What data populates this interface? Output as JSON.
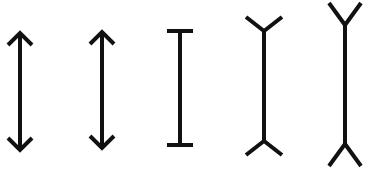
{
  "diagram": {
    "description": "Five vertical line figures with different end terminations (Müller-Lyer style illusion)",
    "stroke_color": "#111111",
    "background_color": "#ffffff",
    "figures": [
      {
        "id": "fig1",
        "type": "double-arrow",
        "label": "double-headed arrow (inward arrowheads)",
        "x": 20,
        "y_top": 33,
        "y_bottom": 150,
        "head_size": 12,
        "stroke_width": 4
      },
      {
        "id": "fig2",
        "type": "double-arrow",
        "label": "double-headed arrow (inward arrowheads)",
        "x": 102,
        "y_top": 32,
        "y_bottom": 148,
        "head_size": 12,
        "stroke_width": 4
      },
      {
        "id": "fig3",
        "type": "i-beam",
        "label": "line with flat end caps",
        "x": 180,
        "y_top": 31,
        "y_bottom": 145,
        "cap_half_width": 13,
        "stroke_width": 4
      },
      {
        "id": "fig4",
        "type": "fork",
        "label": "line with small outward forks",
        "x": 264,
        "y_top": 17,
        "y_bottom": 155,
        "fork_len": 14,
        "fork_spread": 18,
        "stroke_width": 4
      },
      {
        "id": "fig5",
        "type": "fork",
        "label": "line with large outward forks",
        "x": 345,
        "y_top": 3,
        "y_bottom": 166,
        "fork_len": 22,
        "fork_spread": 16,
        "stroke_width": 4
      }
    ]
  }
}
